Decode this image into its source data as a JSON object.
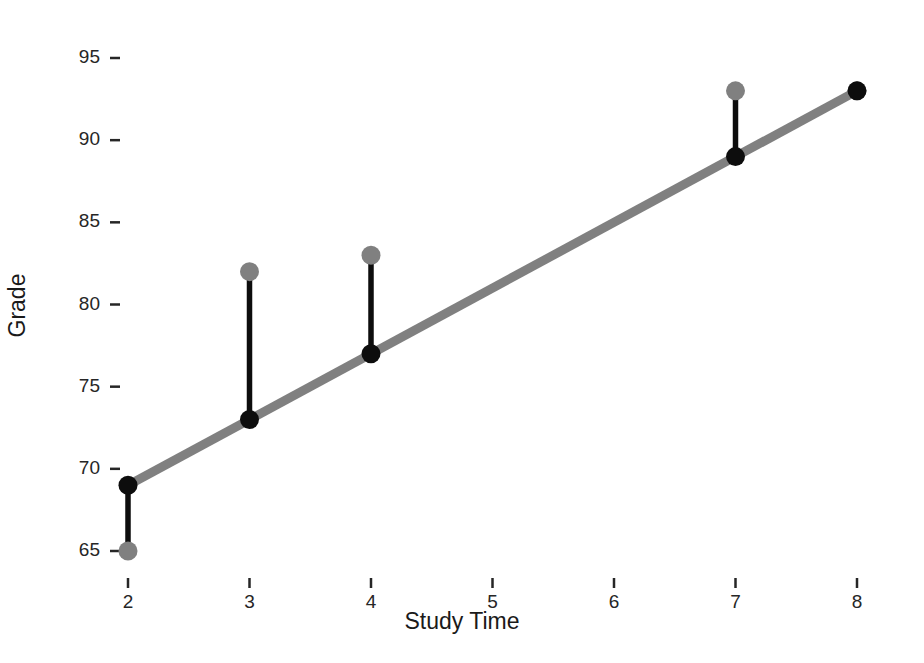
{
  "chart_data": {
    "type": "scatter",
    "title": "",
    "xlabel": "Study Time",
    "ylabel": "Grade",
    "xlim": [
      1.55,
      8.3
    ],
    "ylim": [
      63.2,
      96.4
    ],
    "grid": false,
    "legend": null,
    "x": [
      2,
      3,
      4,
      7,
      8
    ],
    "series": [
      {
        "name": "Observed Grade",
        "role": "observed-points",
        "color": "#808080",
        "values": [
          65,
          82,
          83,
          93,
          93
        ]
      },
      {
        "name": "Fitted Grade",
        "role": "fitted-points",
        "color": "#0d0d0d",
        "values": [
          69,
          73,
          77,
          89,
          93
        ]
      },
      {
        "name": "Residual",
        "role": "residual-segments",
        "color": "#0d0d0d",
        "values": [
          -4,
          9,
          6,
          4,
          0
        ]
      }
    ],
    "regression_line": {
      "name": "Least Squares Fit",
      "color": "#808080",
      "intercept": 61,
      "slope": 4,
      "x_start": 2,
      "x_end": 8,
      "y_start": 69,
      "y_end": 93
    },
    "x_ticks": [
      2,
      3,
      4,
      5,
      6,
      7,
      8
    ],
    "x_tick_labels": [
      "2",
      "3",
      "4",
      "5",
      "6",
      "7",
      "8"
    ],
    "y_ticks": [
      65,
      70,
      75,
      80,
      85,
      90,
      95
    ],
    "y_tick_labels": [
      "65",
      "70",
      "75",
      "80",
      "85",
      "90",
      "95"
    ]
  },
  "axes": {
    "x_title": "Study Time",
    "y_title": "Grade"
  },
  "colors": {
    "background": "#ffffff",
    "line": "#808080",
    "observed_point": "#808080",
    "fitted_point": "#0d0d0d",
    "residual": "#0d0d0d",
    "tick_label": "#262626",
    "axis_title": "#1a1a1a"
  }
}
